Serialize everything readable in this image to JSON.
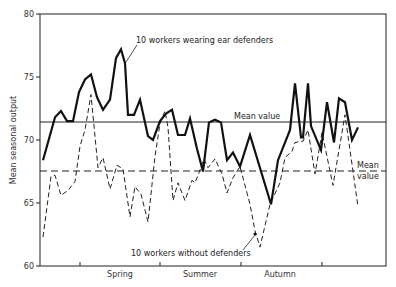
{
  "chart_data": {
    "type": "line",
    "title": "",
    "xlabel": "",
    "ylabel": "Mean seasonal output",
    "ylim": [
      60,
      80
    ],
    "yticks": [
      60,
      65,
      70,
      75,
      80
    ],
    "x_season_labels": [
      "Spring",
      "Summer",
      "Autumn"
    ],
    "grid": false,
    "series": [
      {
        "name": "10 workers wearing ear defenders",
        "style": "solid",
        "mean_value": 71.4,
        "mean_label": "Mean value",
        "x": [
          43,
          55,
          61,
          67,
          73,
          79,
          85,
          91,
          97,
          103,
          110,
          116,
          121,
          125,
          128,
          134,
          140,
          148,
          153,
          160,
          166,
          172,
          178,
          185,
          190,
          197,
          203,
          209,
          215,
          221,
          227,
          233,
          240,
          250,
          271,
          278,
          290,
          295,
          301,
          303,
          308,
          311,
          321,
          327,
          334,
          339,
          345,
          352,
          358
        ],
        "values": [
          68.4,
          71.8,
          72.3,
          71.5,
          71.5,
          73.8,
          74.8,
          75.2,
          73.4,
          72.4,
          73.2,
          76.5,
          77.2,
          76.1,
          72.0,
          72.0,
          73.2,
          70.3,
          70.0,
          71.5,
          72.1,
          72.4,
          70.4,
          70.4,
          71.7,
          69.3,
          67.5,
          71.4,
          71.6,
          71.4,
          68.4,
          69.0,
          67.9,
          70.4,
          64.9,
          68.4,
          70.8,
          74.5,
          70.2,
          70.2,
          74.5,
          71.1,
          69.2,
          73.0,
          69.8,
          73.3,
          73.0,
          70.0,
          71.0
        ]
      },
      {
        "name": "10 workers without defenders",
        "style": "dashed",
        "mean_value": 67.5,
        "mean_label": "Mean value",
        "x": [
          43,
          51,
          55,
          61,
          68,
          75,
          80,
          85,
          91,
          98,
          103,
          110,
          117,
          123,
          130,
          135,
          141,
          148,
          155,
          160,
          165,
          168,
          173,
          178,
          185,
          192,
          195,
          199,
          204,
          208,
          215,
          222,
          227,
          233,
          240,
          250,
          255,
          260,
          270,
          280,
          285,
          292,
          295,
          301,
          303,
          308,
          315,
          322,
          333,
          345,
          358
        ],
        "values": [
          62.3,
          67.1,
          67.2,
          65.6,
          66.0,
          66.7,
          69.5,
          70.8,
          73.6,
          67.8,
          68.6,
          66.1,
          68.0,
          67.7,
          63.9,
          66.3,
          65.7,
          63.5,
          68.7,
          71.3,
          72.3,
          71.0,
          65.2,
          66.6,
          65.2,
          66.8,
          66.6,
          67.4,
          68.5,
          67.8,
          68.5,
          67.3,
          65.8,
          67.0,
          67.9,
          64.9,
          62.8,
          61.5,
          64.9,
          66.6,
          68.6,
          69.1,
          69.8,
          69.9,
          69.9,
          70.8,
          67.3,
          70.6,
          66.4,
          72.0,
          64.7
        ]
      }
    ],
    "annotations": [
      {
        "text": "10  workers wearing ear defenders",
        "target": "solid series"
      },
      {
        "text": "Mean value",
        "target": "solid mean line"
      },
      {
        "text": "10  workers without defenders",
        "target": "dashed series"
      },
      {
        "text": "Mean",
        "target": "dashed mean line"
      },
      {
        "text": "value",
        "target": "dashed mean line"
      }
    ]
  },
  "labels": {
    "ylabel": "Mean seasonal output",
    "y80": "80",
    "y75": "75",
    "y70": "70",
    "y65": "65",
    "y60": "60",
    "spring": "Spring",
    "summer": "Summer",
    "autumn": "Autumn",
    "solid_name": "10  workers wearing ear defenders",
    "dashed_name": "10  workers without defenders",
    "solid_mean": "Mean value",
    "dashed_mean_1": "Mean",
    "dashed_mean_2": "value"
  }
}
